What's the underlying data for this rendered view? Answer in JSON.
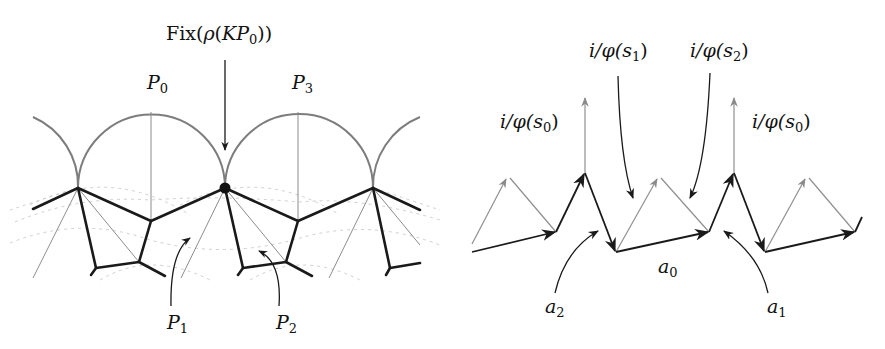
{
  "figure": {
    "left": {
      "labels": {
        "fix": "Fix(ρ(KP₀))",
        "fix_prefix": "Fix(",
        "fix_rho": "ρ",
        "fix_K": "KP",
        "fix_sub": "0",
        "fix_suffix": "))",
        "p0_main": "P",
        "p0_sub": "0",
        "p3_main": "P",
        "p3_sub": "3",
        "p1_main": "P",
        "p1_sub": "1",
        "p2_main": "P",
        "p2_sub": "2"
      },
      "marked_point": "fixed-point-dot"
    },
    "right": {
      "labels": {
        "s0_left": "i/φ(s",
        "s0_left_sub": "0",
        "s0_left_close": ")",
        "s1": "i/φ(s",
        "s1_sub": "1",
        "s1_close": ")",
        "s2": "i/φ(s",
        "s2_sub": "2",
        "s2_close": ")",
        "s0_right": "i/φ(s",
        "s0_right_sub": "0",
        "s0_right_close": ")",
        "a0_main": "a",
        "a0_sub": "0",
        "a1_main": "a",
        "a1_sub": "1",
        "a2_main": "a",
        "a2_sub": "2"
      }
    },
    "colors": {
      "ink": "#1a1a1a",
      "gray_arc": "#808080",
      "light_gray": "#9a9a9a",
      "dashed": "#c8c8c8"
    }
  }
}
